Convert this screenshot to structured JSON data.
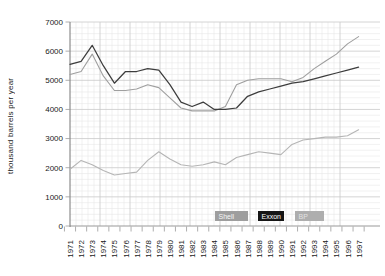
{
  "chart_data": {
    "type": "line",
    "title": "",
    "xlabel": "",
    "ylabel": "thousand barrels per year",
    "ylim": [
      0,
      7000
    ],
    "y_ticks": [
      0,
      1000,
      2000,
      3000,
      4000,
      5000,
      6000,
      7000
    ],
    "x": [
      1971,
      1972,
      1973,
      1974,
      1975,
      1976,
      1977,
      1978,
      1979,
      1980,
      1981,
      1982,
      1983,
      1984,
      1985,
      1986,
      1987,
      1988,
      1989,
      1990,
      1991,
      1992,
      1993,
      1994,
      1995,
      1996,
      1997
    ],
    "x_tick_labels": [
      "1971",
      "1972",
      "1973",
      "1974",
      "1975",
      "1976",
      "1977",
      "1978",
      "1979",
      "1980",
      "1981",
      "1982",
      "1983",
      "1984",
      "1985",
      "1986",
      "1987",
      "1988",
      "1989",
      "1990",
      "1991",
      "1992",
      "1993",
      "1994",
      "1995",
      "1996",
      "1997"
    ],
    "grid": "graph-paper: minor and major gridlines on",
    "legend_position": "inside-bottom chips",
    "series": [
      {
        "name": "Shell",
        "line_color": "#9f9f9f",
        "legend_bg": "#9e9e9e",
        "legend_fg": "#f5f5f5",
        "values": [
          5200,
          5300,
          5900,
          5150,
          4650,
          4650,
          4700,
          4850,
          4750,
          4400,
          4050,
          3950,
          3950,
          3950,
          4100,
          4850,
          5000,
          5050,
          5050,
          5050,
          4950,
          5100,
          5400,
          5650,
          5900,
          6250,
          6500
        ]
      },
      {
        "name": "Exxon",
        "line_color": "#3d3d3d",
        "legend_bg": "#161616",
        "legend_fg": "#ffffff",
        "values": [
          5550,
          5650,
          6200,
          5500,
          4900,
          5300,
          5300,
          5400,
          5350,
          4850,
          4250,
          4100,
          4250,
          4000,
          4000,
          4050,
          4450,
          4600,
          4700,
          4800,
          4900,
          4950,
          5050,
          5150,
          5250,
          5350,
          5450
        ]
      },
      {
        "name": "BP",
        "line_color": "#b5b5b5",
        "legend_bg": "#aeaeae",
        "legend_fg": "#e2e2e2",
        "values": [
          1950,
          2250,
          2100,
          1900,
          1750,
          1800,
          1850,
          2250,
          2550,
          2300,
          2100,
          2050,
          2100,
          2200,
          2100,
          2350,
          2450,
          2550,
          2500,
          2450,
          2800,
          2950,
          3000,
          3050,
          3050,
          3100,
          3300
        ]
      }
    ],
    "axis_colors": {
      "axis_line": "#777777",
      "zero_line": "#999999",
      "major_grid": "#c9c9c9",
      "minor_grid": "#e7e7e7",
      "tick": "#999999",
      "label_text": "#1a1a1a"
    }
  }
}
